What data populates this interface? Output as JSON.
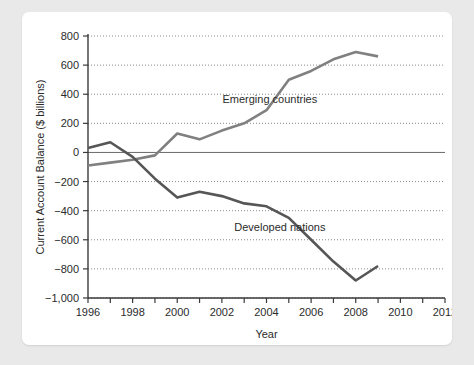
{
  "chart_data": {
    "type": "line",
    "title": "",
    "xlabel": "Year",
    "ylabel": "Current Account Balance ($ billions)",
    "xlim": [
      1996,
      2012
    ],
    "ylim": [
      -1000,
      800
    ],
    "grid": true,
    "legend_position": "inline-annotation",
    "x_tick_labels": [
      "1996",
      "1998",
      "2000",
      "2002",
      "2004",
      "2006",
      "2008",
      "2010",
      "2012"
    ],
    "x_tick_values": [
      1996,
      1997,
      1998,
      1999,
      2000,
      2001,
      2002,
      2003,
      2004,
      2005,
      2006,
      2007,
      2008,
      2009,
      2010,
      2011,
      2012
    ],
    "y_tick_labels": [
      "800",
      "600",
      "400",
      "200",
      "0",
      "-200",
      "-400",
      "-600",
      "-800",
      "-1,000"
    ],
    "y_tick_values": [
      800,
      600,
      400,
      200,
      0,
      -200,
      -400,
      -600,
      -800,
      -1000
    ],
    "zero_line_value": 0,
    "series": [
      {
        "name": "Emerging countries",
        "color": "#808080",
        "annotation_label": "Emerging countries",
        "x": [
          1996,
          1997,
          1998,
          1999,
          2000,
          2001,
          2002,
          2003,
          2004,
          2005,
          2006,
          2007,
          2008,
          2009
        ],
        "values": [
          -90,
          -70,
          -50,
          -20,
          130,
          90,
          150,
          200,
          290,
          500,
          560,
          640,
          690,
          660
        ]
      },
      {
        "name": "Developed nations",
        "color": "#565656",
        "annotation_label": "Developed nations",
        "x": [
          1996,
          1997,
          1998,
          1999,
          2000,
          2001,
          2002,
          2003,
          2004,
          2005,
          2006,
          2007,
          2008,
          2009
        ],
        "values": [
          30,
          70,
          -30,
          -180,
          -310,
          -270,
          -300,
          -350,
          -370,
          -450,
          -600,
          -750,
          -880,
          -780
        ]
      }
    ],
    "annotations": [
      {
        "text": "Emerging countries",
        "x_value": 2004.15,
        "y_value": 340
      },
      {
        "text": "Developed nations",
        "x_value": 2004.6,
        "y_value": -540
      }
    ]
  },
  "colors": {
    "page_background": "#e9e9e9",
    "card_background": "#ffffff",
    "axis": "#3a3a3a",
    "grid": "#8a8a8a",
    "text": "#2b2b2b"
  }
}
